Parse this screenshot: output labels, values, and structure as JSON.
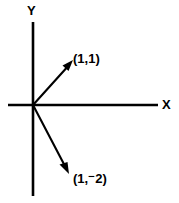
{
  "figure": {
    "background_color": "#ffffff",
    "stroke_color": "#000000",
    "width": 179,
    "height": 203
  },
  "axes": {
    "x_label": "X",
    "y_label": "Y",
    "origin": {
      "x": 33,
      "y": 105
    },
    "x_axis": {
      "x1": 8,
      "y1": 105,
      "x2": 158,
      "y2": 105
    },
    "y_axis": {
      "x1": 33,
      "y1": 22,
      "x2": 33,
      "y2": 196
    }
  },
  "vectors": [
    {
      "name": "vector-1-1",
      "label": "(1,1)",
      "from": {
        "x": 33,
        "y": 105
      },
      "to": {
        "x": 72,
        "y": 62
      },
      "components": [
        1,
        1
      ]
    },
    {
      "name": "vector-1-minus2",
      "label": "(1,⁻2)",
      "from": {
        "x": 33,
        "y": 105
      },
      "to": {
        "x": 68,
        "y": 172
      },
      "components": [
        1,
        -2
      ]
    }
  ]
}
